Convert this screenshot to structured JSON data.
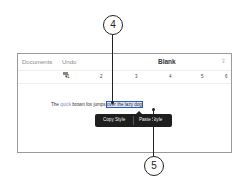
{
  "toolbar": {
    "documents_label": "Documents",
    "undo_label": "Undo",
    "title": "Blank",
    "share_icon": "share-icon"
  },
  "ruler": {
    "marks": [
      "1",
      "2",
      "3",
      "4",
      "5",
      "6"
    ]
  },
  "document": {
    "text_before": "The ",
    "text_quick": "quick",
    "text_mid": " brown fox jumps ",
    "text_selected": "over the lazy dog",
    "text_after": ""
  },
  "popup": {
    "copy_style_label": "Copy Style",
    "paste_style_label": "Paste Style"
  },
  "callouts": {
    "top": "4",
    "bottom": "5"
  }
}
